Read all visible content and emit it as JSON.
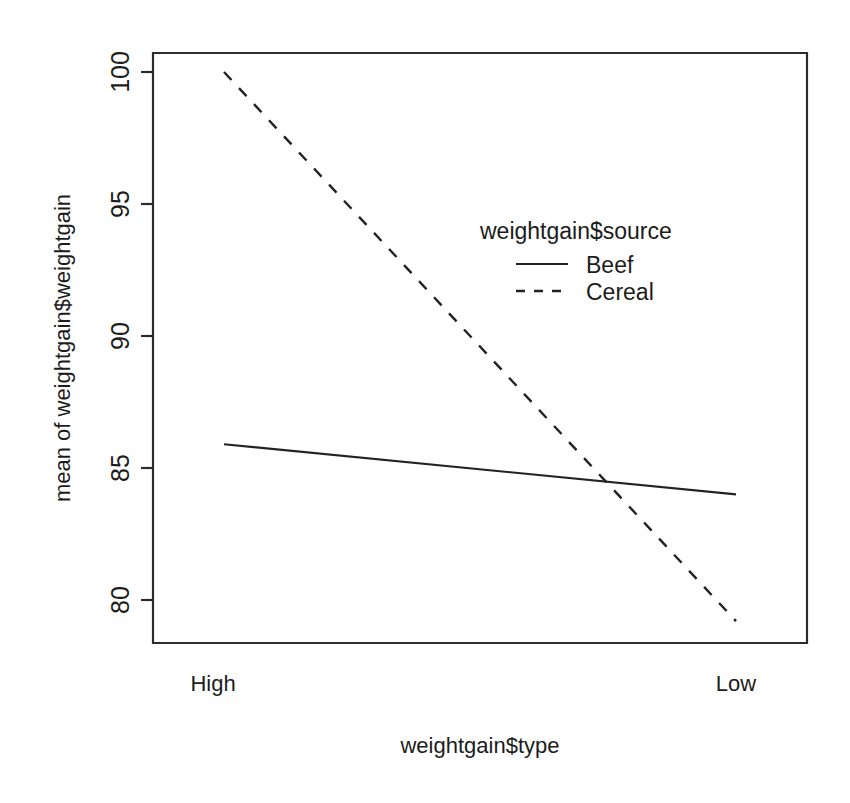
{
  "chart_data": {
    "type": "line",
    "title": "",
    "subtitle": "",
    "xlabel": "weightgain$type",
    "ylabel": "mean of weightgain$weightgain",
    "categories": [
      "High",
      "Low"
    ],
    "xtick_labels": [
      "High",
      "Low"
    ],
    "ytick_labels": [
      "80",
      "85",
      "90",
      "95",
      "100"
    ],
    "ytick_values": [
      80,
      95,
      90,
      95,
      100
    ],
    "yticks": [
      80,
      85,
      90,
      95,
      100
    ],
    "ylim": [
      79.0,
      100.9
    ],
    "grid": false,
    "legend_position": "inside-upper-right",
    "legend_title": "weightgain$source",
    "series": [
      {
        "name": "Beef",
        "linestyle": "solid",
        "color": "#222222",
        "values": [
          85.9,
          84.0
        ]
      },
      {
        "name": "Cereal",
        "linestyle": "dashed",
        "color": "#222222",
        "values": [
          100.0,
          79.2
        ]
      }
    ]
  },
  "axes": {
    "y_axis_label": "mean of weightgain$weightgain",
    "x_axis_label": "weightgain$type",
    "y_ticks": [
      {
        "label": "100",
        "value": 100
      },
      {
        "label": "95",
        "value": 95
      },
      {
        "label": "90",
        "value": 90
      },
      {
        "label": "85",
        "value": 85
      },
      {
        "label": "80",
        "value": 80
      }
    ],
    "x_ticks": [
      {
        "label": "High"
      },
      {
        "label": "Low"
      }
    ]
  },
  "legend": {
    "title": "weightgain$source",
    "items": [
      {
        "label": "Beef",
        "style": "solid"
      },
      {
        "label": "Cereal",
        "style": "dashed"
      }
    ]
  },
  "style": {
    "line_color": "#222222",
    "axis_color": "#2b2b2b",
    "background": "#ffffff"
  }
}
